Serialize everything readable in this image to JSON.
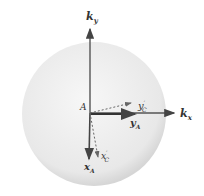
{
  "diagram": {
    "sphere": {
      "fill_center": "#f4f4f4",
      "fill_edge": "#dcdcdc"
    },
    "origin_label": "A",
    "axes": {
      "ky": {
        "label": "k",
        "sub": "y"
      },
      "kx": {
        "label": "k",
        "sub": "x"
      },
      "yA": {
        "label": "y",
        "sub": "A"
      },
      "xA": {
        "label": "x",
        "sub": "A"
      },
      "yC": {
        "label": "y",
        "sub": "C",
        "prime": "′"
      },
      "xC": {
        "label": "x",
        "sub": "C",
        "prime": "′"
      }
    },
    "colors": {
      "axis": "#555555",
      "dashed": "#666666"
    }
  }
}
